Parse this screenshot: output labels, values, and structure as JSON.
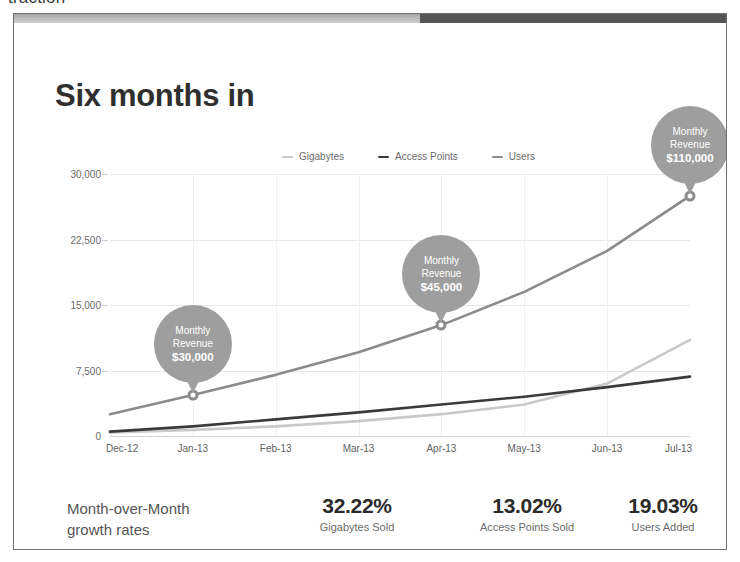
{
  "clipped_header_text": "traction",
  "slide": {
    "title": "Six months in"
  },
  "legend": [
    {
      "label": "Gigabytes",
      "color": "#c9c9c9"
    },
    {
      "label": "Access Points",
      "color": "#3a3a3a"
    },
    {
      "label": "Users",
      "color": "#8b8b8b"
    }
  ],
  "callouts": [
    {
      "line1": "Monthly",
      "line2": "Revenue",
      "amount": "$30,000"
    },
    {
      "line1": "Monthly",
      "line2": "Revenue",
      "amount": "$45,000"
    },
    {
      "line1": "Monthly",
      "line2": "Revenue",
      "amount": "$110,000"
    }
  ],
  "footer": {
    "label_line1": "Month-over-Month",
    "label_line2": "growth rates",
    "stats": [
      {
        "value": "32.22%",
        "caption": "Gigabytes Sold"
      },
      {
        "value": "13.02%",
        "caption": "Access Points Sold"
      },
      {
        "value": "19.03%",
        "caption": "Users Added"
      }
    ]
  },
  "chart_data": {
    "type": "line",
    "title": "Six months in",
    "xlabel": "",
    "ylabel": "",
    "grid": true,
    "legend_position": "top-center",
    "x": [
      "Dec-12",
      "Jan-13",
      "Feb-13",
      "Mar-13",
      "Apr-13",
      "May-13",
      "Jun-13",
      "Jul-13"
    ],
    "ylim": [
      0,
      30000
    ],
    "yticks": [
      0,
      7500,
      15000,
      22500,
      30000
    ],
    "ytick_labels": [
      "0",
      "7,500",
      "15,000",
      "22,500",
      "30,000"
    ],
    "series": [
      {
        "name": "Gigabytes",
        "color": "#c9c9c9",
        "values": [
          400,
          700,
          1100,
          1700,
          2500,
          3600,
          6000,
          11000
        ]
      },
      {
        "name": "Access Points",
        "color": "#3a3a3a",
        "values": [
          500,
          1100,
          1900,
          2700,
          3600,
          4500,
          5600,
          6800
        ]
      },
      {
        "name": "Users",
        "color": "#8b8b8b",
        "values": [
          2500,
          4700,
          7000,
          9600,
          12700,
          16500,
          21200,
          27500
        ]
      }
    ],
    "annotations": [
      {
        "series": "Users",
        "x": "Jan-13",
        "y": 4700,
        "text": "Monthly Revenue $30,000"
      },
      {
        "series": "Users",
        "x": "Apr-13",
        "y": 12700,
        "text": "Monthly Revenue $45,000"
      },
      {
        "series": "Users",
        "x": "Jul-13",
        "y": 27500,
        "text": "Monthly Revenue $110,000"
      }
    ]
  }
}
